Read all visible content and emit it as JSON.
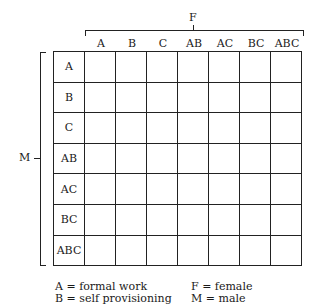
{
  "diagram": {
    "top_axis": {
      "title": "F",
      "columns": [
        "A",
        "B",
        "C",
        "AB",
        "AC",
        "BC",
        "ABC"
      ]
    },
    "left_axis": {
      "title": "M",
      "rows": [
        "A",
        "B",
        "C",
        "AB",
        "AC",
        "BC",
        "ABC"
      ]
    }
  },
  "legend": {
    "left": [
      "A = formal work",
      "B = self provisioning"
    ],
    "right": [
      "F = female",
      "M = male"
    ]
  }
}
